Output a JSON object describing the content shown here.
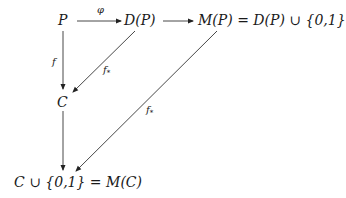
{
  "diagram": {
    "type": "commutative-diagram",
    "nodes": {
      "P": {
        "label": "P"
      },
      "DP": {
        "label": "D(P)"
      },
      "MP": {
        "label": "M(P) = D(P) ∪ {0,1}"
      },
      "C": {
        "label": "C"
      },
      "MC": {
        "label": "C ∪ {0,1} = M(C)"
      }
    },
    "edges": {
      "phi": {
        "from": "P",
        "to": "D(P)",
        "label": "φ"
      },
      "inc": {
        "from": "D(P)",
        "to": "M(P)",
        "label": ""
      },
      "f": {
        "from": "P",
        "to": "C",
        "label": "f"
      },
      "fstar1": {
        "from": "D(P)",
        "to": "C",
        "label": "f",
        "sub": "*"
      },
      "fstar2": {
        "from": "M(P)",
        "to": "M(C)",
        "label": "f",
        "sub": "*"
      },
      "inc2": {
        "from": "C",
        "to": "M(C)",
        "label": ""
      }
    },
    "colors": {
      "line": "#333333",
      "text": "#1a1a1a",
      "background": "#ffffff"
    }
  }
}
